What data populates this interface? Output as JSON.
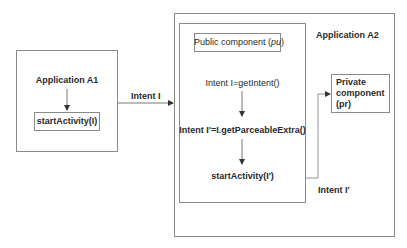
{
  "diagram": {
    "app_a1": {
      "title": "Application A1",
      "call_label": "startActivity(I)"
    },
    "intent_i_label": "Intent I",
    "app_a2": {
      "title": "Application A2",
      "public_component": {
        "title_prefix": "Public component (",
        "title_abbr": "pu",
        "title_suffix": ")",
        "steps": [
          "Intent I=getIntent()",
          "Intent I'=I.getParceableExtra()",
          "startActivity(I')"
        ]
      },
      "private_component": {
        "lines": [
          "Private",
          "component",
          "(pr)"
        ]
      }
    },
    "intent_i_prime_label": "Intent I'",
    "colors": {
      "border": "#8a8a8a",
      "text": "#2a2a2a",
      "arrow": "#333333"
    }
  }
}
